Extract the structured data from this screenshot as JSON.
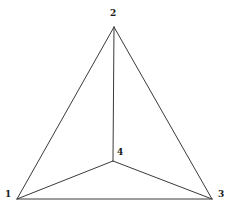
{
  "figure": {
    "kind": "graph-diagram",
    "width": 229,
    "height": 213,
    "background_color": "#ffffff",
    "edge_color": "#3a3a3a",
    "label_color": "#1a1a1a",
    "edge_width": 1
  },
  "chart_data": {
    "type": "diagram",
    "title": "",
    "xlabel": "",
    "ylabel": "",
    "nodes": [
      {
        "id": "1",
        "label": "1",
        "x": 17,
        "y": 199,
        "label_x": 5,
        "label_y": 190,
        "label_anchor": "left"
      },
      {
        "id": "2",
        "label": "2",
        "x": 114,
        "y": 27,
        "label_x": 110,
        "label_y": 9,
        "label_anchor": "top"
      },
      {
        "id": "3",
        "label": "3",
        "x": 212,
        "y": 199,
        "label_x": 218,
        "label_y": 190,
        "label_anchor": "right"
      },
      {
        "id": "4",
        "label": "4",
        "x": 113,
        "y": 161,
        "label_x": 117,
        "label_y": 148,
        "label_anchor": "top-right"
      }
    ],
    "edges": [
      {
        "from": "1",
        "to": "2",
        "name": "edge-1-2"
      },
      {
        "from": "2",
        "to": "3",
        "name": "edge-2-3"
      },
      {
        "from": "1",
        "to": "3",
        "name": "edge-1-3"
      },
      {
        "from": "4",
        "to": "1",
        "name": "edge-4-1"
      },
      {
        "from": "4",
        "to": "2",
        "name": "edge-4-2"
      },
      {
        "from": "4",
        "to": "3",
        "name": "edge-4-3"
      }
    ],
    "node_count": 4,
    "edge_count": 6
  }
}
